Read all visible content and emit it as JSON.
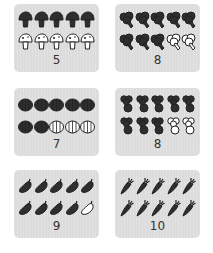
{
  "worksheet": {
    "cards": [
      {
        "vegetable": "mushroom",
        "count": "5",
        "filled": 5,
        "total": 10,
        "label": "5"
      },
      {
        "vegetable": "broccoli",
        "count": "8",
        "filled": 8,
        "total": 10,
        "label": "8"
      },
      {
        "vegetable": "pumpkin",
        "count": "7",
        "filled": 7,
        "total": 10,
        "label": "7"
      },
      {
        "vegetable": "beet",
        "count": "8",
        "filled": 8,
        "total": 10,
        "label": "8"
      },
      {
        "vegetable": "eggplant",
        "count": "9",
        "filled": 9,
        "total": 10,
        "label": "9"
      },
      {
        "vegetable": "carrot",
        "count": "10",
        "filled": 10,
        "total": 10,
        "label": "10"
      }
    ]
  },
  "colors": {
    "card_bg": "#dcdcdc",
    "icon_filled": "#2e2e2e",
    "icon_empty": "#ffffff",
    "number": "#333333"
  }
}
